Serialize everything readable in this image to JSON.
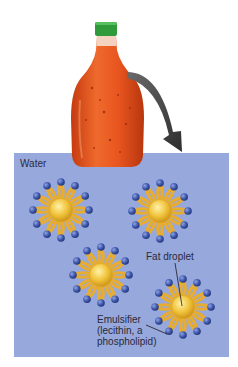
{
  "figure": {
    "water_label": "Water",
    "labels": {
      "fat_droplet": "Fat droplet",
      "emulsifier_line1": "Emulsifier",
      "emulsifier_line2": "(lecithin, a",
      "emulsifier_line3": "phospholipid)"
    },
    "colors": {
      "water": "#97a8dc",
      "cap": "#2f9a3a",
      "dressing": "#e2541e",
      "arrow": "#4a4a4a",
      "fat_core": "#f0c23a",
      "tail": "#eeb53a",
      "head": "#3b54a8"
    },
    "droplets": [
      {
        "cx": 61,
        "cy": 210
      },
      {
        "cx": 160,
        "cy": 211
      },
      {
        "cx": 101,
        "cy": 275
      },
      {
        "cx": 183,
        "cy": 307
      }
    ],
    "icons": {
      "bottle": "salad-dressing-bottle-icon",
      "arrow": "curved-down-arrow-icon"
    }
  }
}
